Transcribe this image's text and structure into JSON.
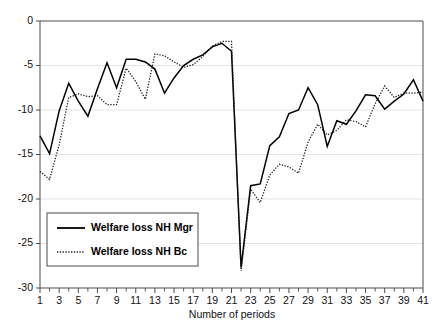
{
  "chart_data": {
    "type": "line",
    "title": "",
    "xlabel": "Number of periods",
    "ylabel": "",
    "xlim": [
      1,
      41
    ],
    "ylim": [
      -30,
      0
    ],
    "grid": true,
    "legend_position": "lower-left",
    "yticks": [
      0,
      -5,
      -10,
      -15,
      -20,
      -25,
      -30
    ],
    "ytick_labels": [
      "0",
      "-5",
      "-10",
      "-15",
      "-20",
      "-25",
      "-30"
    ],
    "xticks": [
      1,
      3,
      5,
      7,
      9,
      11,
      13,
      15,
      17,
      19,
      21,
      23,
      25,
      27,
      29,
      31,
      33,
      35,
      37,
      39,
      41
    ],
    "xtick_labels": [
      "1",
      "3",
      "5",
      "7",
      "9",
      "11",
      "13",
      "15",
      "17",
      "19",
      "21",
      "23",
      "25",
      "27",
      "29",
      "31",
      "33",
      "35",
      "37",
      "39",
      "41"
    ],
    "x": [
      1,
      2,
      3,
      4,
      5,
      6,
      7,
      8,
      9,
      10,
      11,
      12,
      13,
      14,
      15,
      16,
      17,
      18,
      19,
      20,
      21,
      22,
      23,
      24,
      25,
      26,
      27,
      28,
      29,
      30,
      31,
      32,
      33,
      34,
      35,
      36,
      37,
      38,
      39,
      40,
      41
    ],
    "series": [
      {
        "name": "Welfare loss NH Mgr",
        "style": "solid",
        "color": "#000000",
        "values": [
          -12.9,
          -14.9,
          -10.1,
          -7.0,
          -9.0,
          -10.7,
          -7.6,
          -4.7,
          -7.5,
          -4.3,
          -4.3,
          -4.6,
          -5.4,
          -8.1,
          -6.4,
          -5.0,
          -4.3,
          -3.8,
          -2.9,
          -2.5,
          -3.4,
          -27.7,
          -18.5,
          -18.3,
          -14.0,
          -13.0,
          -10.4,
          -10.0,
          -7.5,
          -9.4,
          -14.1,
          -11.2,
          -11.6,
          -10.1,
          -8.3,
          -8.4,
          -9.9,
          -9.0,
          -8.2,
          -6.6,
          -9.0
        ]
      },
      {
        "name": "Welfare loss NH Bc",
        "style": "dotted",
        "color": "#1a1a1a",
        "values": [
          -16.9,
          -17.8,
          -13.9,
          -8.6,
          -8.2,
          -8.5,
          -8.4,
          -9.4,
          -9.4,
          -5.3,
          -6.8,
          -8.8,
          -3.7,
          -3.9,
          -4.6,
          -5.2,
          -4.9,
          -4.0,
          -2.8,
          -2.3,
          -2.3,
          -28.1,
          -18.9,
          -20.4,
          -17.3,
          -16.1,
          -16.4,
          -17.1,
          -13.6,
          -11.6,
          -12.8,
          -12.3,
          -11.1,
          -11.3,
          -11.9,
          -9.3,
          -7.3,
          -8.6,
          -8.1,
          -8.1,
          -8.0
        ]
      }
    ]
  },
  "legend": {
    "items": [
      {
        "label": "Welfare loss NH Mgr",
        "style": "solid"
      },
      {
        "label": "Welfare loss NH Bc",
        "style": "dotted"
      }
    ]
  },
  "axes": {
    "x_title": "Number of periods"
  },
  "caption": {
    "text": ""
  }
}
